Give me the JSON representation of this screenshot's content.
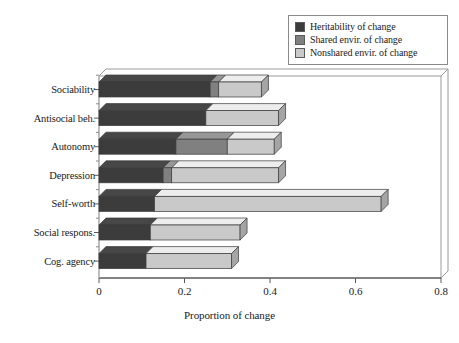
{
  "chart_data": {
    "type": "bar",
    "orientation": "horizontal",
    "stacked": true,
    "three_d": true,
    "title": "",
    "xlabel": "Proportion of change",
    "ylabel": "",
    "xlim": [
      0,
      0.8
    ],
    "xticks": [
      "0",
      "0.2",
      "0.4",
      "0.6",
      "0.8"
    ],
    "xtick_values": [
      0,
      0.2,
      0.4,
      0.6,
      0.8
    ],
    "grid": false,
    "legend_position": "top-right",
    "categories": [
      "Sociability",
      "Antisocial beh.",
      "Autonomy",
      "Depression",
      "Self-worth",
      "Social respons.",
      "Cog. agency"
    ],
    "series": [
      {
        "name": "Heritability of change",
        "color": "#3c3c3c",
        "values": [
          0.26,
          0.25,
          0.18,
          0.15,
          0.13,
          0.12,
          0.11
        ]
      },
      {
        "name": "Shared envir. of change",
        "color": "#808080",
        "values": [
          0.02,
          0.0,
          0.12,
          0.02,
          0.0,
          0.0,
          0.0
        ]
      },
      {
        "name": "Nonshared envir. of change",
        "color": "#c9c9c9",
        "values": [
          0.1,
          0.17,
          0.11,
          0.25,
          0.53,
          0.21,
          0.2
        ]
      }
    ],
    "totals": [
      0.38,
      0.42,
      0.41,
      0.42,
      0.66,
      0.33,
      0.31
    ]
  },
  "legend": {
    "items": [
      {
        "label": "Heritability of change",
        "color": "#3c3c3c"
      },
      {
        "label": "Shared envir. of change",
        "color": "#808080"
      },
      {
        "label": "Nonshared envir. of change",
        "color": "#c9c9c9"
      }
    ]
  },
  "axis": {
    "x_title": "Proportion of change",
    "x_ticks": [
      "0",
      "0.2",
      "0.4",
      "0.6",
      "0.8"
    ]
  }
}
